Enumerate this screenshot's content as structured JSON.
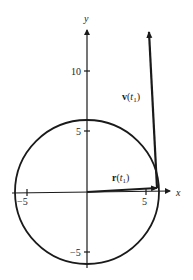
{
  "figure": {
    "type": "diagram",
    "axes": {
      "x_label": "x",
      "y_label": "y",
      "x_ticks": [
        {
          "value": -5,
          "label": "−5"
        },
        {
          "value": 5,
          "label": "5"
        }
      ],
      "y_ticks": [
        {
          "value": 10,
          "label": "10"
        },
        {
          "value": 5,
          "label": "5"
        },
        {
          "value": -5,
          "label": "−5"
        }
      ]
    },
    "circle": {
      "center": [
        0,
        0
      ],
      "radius": 6
    },
    "vectors": [
      {
        "name": "position",
        "label_main": "r",
        "label_arg": "t",
        "label_sub": "1",
        "from": [
          0,
          0
        ],
        "to": [
          5.95,
          0.35
        ]
      },
      {
        "name": "velocity",
        "label_main": "v",
        "label_arg": "t",
        "label_sub": "1",
        "from": [
          5.95,
          0.35
        ],
        "to": [
          5.1,
          13.5
        ]
      }
    ]
  }
}
